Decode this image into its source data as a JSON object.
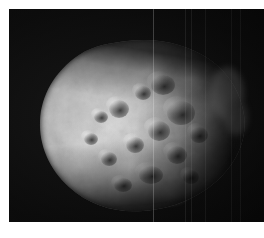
{
  "figure": {
    "subject_name": "asteroid-nucleus",
    "description": "Grayscale spacecraft image of an irregular, heavily cratered small body against black sky",
    "image_type": "grayscale-photograph",
    "frame": {
      "x": 9,
      "y": 9,
      "width": 255,
      "height": 213,
      "background_color": "#050505",
      "page_background_color": "#ffffff"
    },
    "body": {
      "outline_points": "centered irregular rounded triangle, bright left limb, diffuse right terminator",
      "bounding_box": {
        "x": 31,
        "y": 35,
        "width": 210,
        "height": 172
      },
      "surface": "mottled, crater-pocked regolith",
      "highlight_color": "#d8d8d8",
      "midtone_color": "#9a9a9a",
      "shadow_color": "#4a4a4a",
      "terminator_color": "#151515"
    },
    "artifacts": {
      "vertical_streak_positions": [
        144,
        176,
        182,
        196,
        222,
        231
      ],
      "streak_color": "#afafaf"
    },
    "craters": [
      {
        "cx": 88,
        "cy": 74,
        "r": 9,
        "depth": 0.45
      },
      {
        "cx": 112,
        "cy": 58,
        "r": 7,
        "depth": 0.4
      },
      {
        "cx": 132,
        "cy": 50,
        "r": 11,
        "depth": 0.5
      },
      {
        "cx": 150,
        "cy": 78,
        "r": 13,
        "depth": 0.55
      },
      {
        "cx": 128,
        "cy": 96,
        "r": 10,
        "depth": 0.5
      },
      {
        "cx": 104,
        "cy": 110,
        "r": 8,
        "depth": 0.42
      },
      {
        "cx": 78,
        "cy": 124,
        "r": 7,
        "depth": 0.38
      },
      {
        "cx": 146,
        "cy": 120,
        "r": 9,
        "depth": 0.46
      },
      {
        "cx": 168,
        "cy": 100,
        "r": 8,
        "depth": 0.44
      },
      {
        "cx": 120,
        "cy": 140,
        "r": 11,
        "depth": 0.4
      },
      {
        "cx": 92,
        "cy": 150,
        "r": 8,
        "depth": 0.36
      },
      {
        "cx": 60,
        "cy": 104,
        "r": 6,
        "depth": 0.3
      },
      {
        "cx": 160,
        "cy": 142,
        "r": 7,
        "depth": 0.38
      },
      {
        "cx": 70,
        "cy": 82,
        "r": 6,
        "depth": 0.32
      }
    ],
    "bright_patches": [
      {
        "cx": 58,
        "cy": 108,
        "r": 26,
        "level": 0.9
      },
      {
        "cx": 86,
        "cy": 92,
        "r": 22,
        "level": 0.82
      },
      {
        "cx": 120,
        "cy": 36,
        "r": 20,
        "level": 0.78
      },
      {
        "cx": 160,
        "cy": 44,
        "r": 18,
        "level": 0.8
      },
      {
        "cx": 100,
        "cy": 132,
        "r": 24,
        "level": 0.8
      },
      {
        "cx": 140,
        "cy": 160,
        "r": 18,
        "level": 0.68
      },
      {
        "cx": 182,
        "cy": 70,
        "r": 16,
        "level": 0.62
      },
      {
        "cx": 48,
        "cy": 130,
        "r": 18,
        "level": 0.74
      }
    ]
  }
}
